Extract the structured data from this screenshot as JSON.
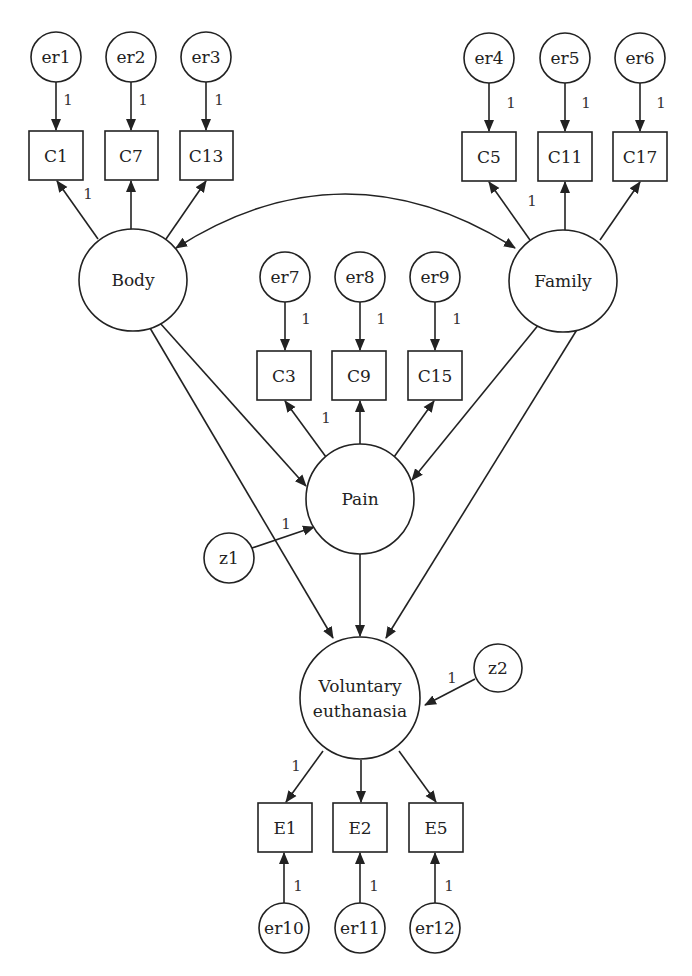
{
  "diagram": {
    "type": "structural-equation-model",
    "latent_variables": [
      {
        "id": "body",
        "label": "Body",
        "cx": 133,
        "cy": 280,
        "rx": 55,
        "ry": 50
      },
      {
        "id": "family",
        "label": "Family",
        "cx": 563,
        "cy": 280,
        "rx": 55,
        "ry": 50
      },
      {
        "id": "pain",
        "label": "Pain",
        "cx": 358,
        "cy": 498,
        "rx": 54,
        "ry": 54
      },
      {
        "id": "ve",
        "label_line1": "Voluntary",
        "label_line2": "euthanasia",
        "cx": 357,
        "cy": 698,
        "rx": 60,
        "ry": 61
      }
    ],
    "observed_variables": [
      {
        "id": "C1",
        "label": "C1",
        "x": 29,
        "y": 131
      },
      {
        "id": "C7",
        "label": "C7",
        "x": 105,
        "y": 131
      },
      {
        "id": "C13",
        "label": "C13",
        "x": 180,
        "y": 131
      },
      {
        "id": "C5",
        "label": "C5",
        "x": 462,
        "y": 132
      },
      {
        "id": "C11",
        "label": "C11",
        "x": 538,
        "y": 132
      },
      {
        "id": "C17",
        "label": "C17",
        "x": 613,
        "y": 132
      },
      {
        "id": "C3",
        "label": "C3",
        "x": 257,
        "y": 351
      },
      {
        "id": "C9",
        "label": "C9",
        "x": 332,
        "y": 351
      },
      {
        "id": "C15",
        "label": "C15",
        "x": 408,
        "y": 351
      },
      {
        "id": "E1",
        "label": "E1",
        "x": 258,
        "y": 803
      },
      {
        "id": "E2",
        "label": "E2",
        "x": 333,
        "y": 803
      },
      {
        "id": "E5",
        "label": "E5",
        "x": 409,
        "y": 803
      }
    ],
    "error_terms": [
      {
        "id": "er1",
        "label": "er1",
        "cx": 56,
        "cy": 57
      },
      {
        "id": "er2",
        "label": "er2",
        "cx": 131,
        "cy": 57
      },
      {
        "id": "er3",
        "label": "er3",
        "cx": 206,
        "cy": 57
      },
      {
        "id": "er4",
        "label": "er4",
        "cx": 489,
        "cy": 58
      },
      {
        "id": "er5",
        "label": "er5",
        "cx": 565,
        "cy": 58
      },
      {
        "id": "er6",
        "label": "er6",
        "cx": 640,
        "cy": 58
      },
      {
        "id": "er7",
        "label": "er7",
        "cx": 285,
        "cy": 277
      },
      {
        "id": "er8",
        "label": "er8",
        "cx": 360,
        "cy": 277
      },
      {
        "id": "er9",
        "label": "er9",
        "cx": 435,
        "cy": 277
      },
      {
        "id": "er10",
        "label": "er10",
        "cx": 284,
        "cy": 928
      },
      {
        "id": "er11",
        "label": "er11",
        "cx": 360,
        "cy": 928
      },
      {
        "id": "er12",
        "label": "er12",
        "cx": 435,
        "cy": 928
      },
      {
        "id": "z1",
        "label": "z1",
        "cx": 229,
        "cy": 558
      },
      {
        "id": "z2",
        "label": "z2",
        "cx": 498,
        "cy": 668
      }
    ],
    "path_weights": {
      "er1_C1": "1",
      "er2_C7": "1",
      "er3_C13": "1",
      "er4_C5": "1",
      "er5_C11": "1",
      "er6_C17": "1",
      "er7_C3": "1",
      "er8_C9": "1",
      "er9_C15": "1",
      "body_C1": "1",
      "family_C5": "1",
      "pain_C3": "1",
      "z1_pain": "1",
      "z2_ve": "1",
      "ve_E1": "1",
      "er10_E1": "1",
      "er11_E2": "1",
      "er12_E5": "1"
    }
  }
}
